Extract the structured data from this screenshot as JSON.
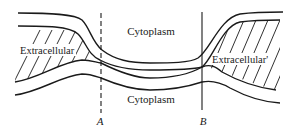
{
  "diagram": {
    "type": "membrane-junction-cross-section",
    "labels": {
      "cytoplasm_top": "Cytoplasm",
      "cytoplasm_bottom": "Cytoplasm",
      "extracellular_left": "Extracellular",
      "extracellular_right": "Extracellular'",
      "line_a": "A",
      "line_b": "B"
    },
    "markers": [
      {
        "id": "A",
        "x": 101,
        "style": "dashed"
      },
      {
        "id": "B",
        "x": 202,
        "style": "solid"
      }
    ],
    "colors": {
      "ink": "#1a1a1a",
      "background": "#ffffff"
    }
  }
}
